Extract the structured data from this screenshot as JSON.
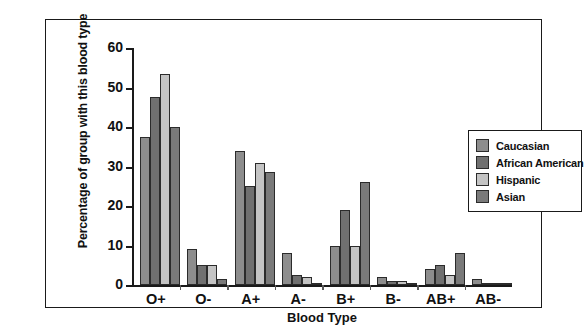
{
  "chart_data": {
    "type": "bar",
    "title": "",
    "xlabel": "Blood Type",
    "ylabel": "Percentage of group with this blood type",
    "categories": [
      "O+",
      "O-",
      "A+",
      "A-",
      "B+",
      "B-",
      "AB+",
      "AB-"
    ],
    "ylim": [
      0,
      60
    ],
    "yticks": [
      0,
      10,
      20,
      30,
      40,
      50,
      60
    ],
    "grid": false,
    "legend_position": "right",
    "series": [
      {
        "name": "Caucasian",
        "color": "#8d8d8d",
        "values": [
          37.5,
          9,
          34,
          8,
          10,
          2,
          4,
          1.5
        ]
      },
      {
        "name": "African American",
        "color": "#707070",
        "values": [
          47.5,
          5,
          25,
          2.5,
          19,
          1,
          5,
          0.3
        ]
      },
      {
        "name": "Hispanic",
        "color": "#c4c4c4",
        "values": [
          53.5,
          5,
          31,
          2,
          10,
          1,
          2.5,
          0.2
        ]
      },
      {
        "name": "Asian",
        "color": "#7a7a7a",
        "values": [
          40,
          1.5,
          28.5,
          0.5,
          26,
          0.5,
          8,
          0.2
        ]
      }
    ]
  }
}
